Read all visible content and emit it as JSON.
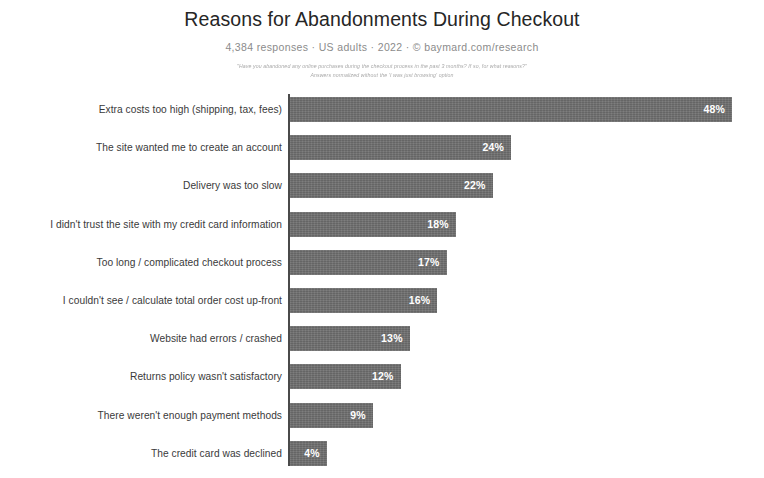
{
  "chart_data": {
    "type": "bar",
    "orientation": "horizontal",
    "title": "Reasons for Abandonments During Checkout",
    "subtitle": "4,384 responses  ·  US adults  ·  2022  ·  ©  baymard.com/research",
    "footnote_line_1": "\"Have you abandoned any online purchases during the checkout process in the past 3 months? If so, for what reasons?\"",
    "footnote_line_2": "Answers normalized without the 'I was just browsing' option",
    "xlabel": "",
    "ylabel": "",
    "xlim": [
      0,
      48
    ],
    "grid": false,
    "legend": false,
    "value_suffix": "%",
    "categories": [
      "Extra costs too high (shipping, tax, fees)",
      "The site wanted me to create an account",
      "Delivery was too slow",
      "I didn't trust the site with my credit card information",
      "Too long / complicated checkout process",
      "I couldn't see / calculate total order cost up-front",
      "Website had errors / crashed",
      "Returns policy wasn't satisfactory",
      "There weren't enough payment methods",
      "The credit card was declined"
    ],
    "values": [
      48,
      24,
      22,
      18,
      17,
      16,
      13,
      12,
      9,
      4
    ],
    "value_labels": [
      "48%",
      "24%",
      "22%",
      "18%",
      "17%",
      "16%",
      "13%",
      "12%",
      "9%",
      "4%"
    ],
    "colors": {
      "bar": "#6f6f6f",
      "axis": "#4a4a4a",
      "title": "#262626",
      "subtitle": "#8b8b8b",
      "label": "#3a3a3a",
      "value": "#ffffff",
      "background": "#ffffff"
    }
  }
}
